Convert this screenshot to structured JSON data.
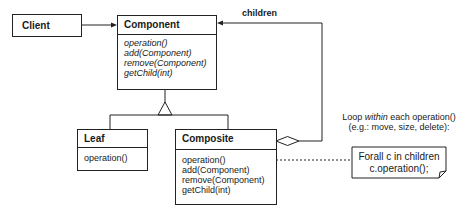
{
  "diagram": {
    "client": {
      "name": "Client"
    },
    "component": {
      "name": "Component",
      "methods": [
        "operation()",
        "add(Component)",
        "remove(Component)",
        "getChild(int)"
      ],
      "methods_style": "italic"
    },
    "leaf": {
      "name": "Leaf",
      "methods": [
        "operation()"
      ]
    },
    "composite": {
      "name": "Composite",
      "methods": [
        "operation()",
        "add(Component)",
        "remove(Component)",
        "getChild(int)"
      ]
    },
    "association_label": "children",
    "annotation": {
      "line1_prefix": "Loop ",
      "line1_em": "within",
      "line1_suffix": " each operation()",
      "line2": "(e.g.: move, size, delete):"
    },
    "note": {
      "line1": "Forall c in children",
      "line2": "c.operation();"
    },
    "colors": {
      "line": "#222222",
      "background": "#ffffff"
    }
  }
}
